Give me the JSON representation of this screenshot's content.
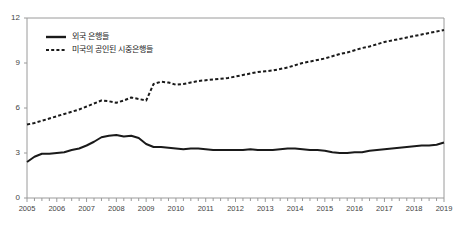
{
  "chart_data": {
    "type": "line",
    "title": "",
    "subtitle": "",
    "xlabel": "",
    "ylabel": "",
    "xlim": [
      2005,
      2019
    ],
    "ylim": [
      0,
      12
    ],
    "yticks": [
      0,
      3,
      6,
      9,
      12
    ],
    "xticks": [
      2005,
      2006,
      2007,
      2008,
      2009,
      2010,
      2011,
      2012,
      2013,
      2014,
      2015,
      2016,
      2017,
      2018,
      2019
    ],
    "grid": false,
    "legend_position": "top-left",
    "minor_ticks_per_year": 4,
    "series": [
      {
        "name": "외국 은행들",
        "style": "solid",
        "color": "#1a1a1a",
        "x": [
          2005.0,
          2005.25,
          2005.5,
          2005.75,
          2006.0,
          2006.25,
          2006.5,
          2006.75,
          2007.0,
          2007.25,
          2007.5,
          2007.75,
          2008.0,
          2008.25,
          2008.5,
          2008.75,
          2009.0,
          2009.25,
          2009.5,
          2009.75,
          2010.0,
          2010.25,
          2010.5,
          2010.75,
          2011.0,
          2011.25,
          2011.5,
          2011.75,
          2012.0,
          2012.25,
          2012.5,
          2012.75,
          2013.0,
          2013.25,
          2013.5,
          2013.75,
          2014.0,
          2014.25,
          2014.5,
          2014.75,
          2015.0,
          2015.25,
          2015.5,
          2015.75,
          2016.0,
          2016.25,
          2016.5,
          2016.75,
          2017.0,
          2017.25,
          2017.5,
          2017.75,
          2018.0,
          2018.25,
          2018.5,
          2018.75,
          2019.0
        ],
        "values": [
          2.4,
          2.75,
          2.95,
          2.95,
          3.0,
          3.05,
          3.2,
          3.3,
          3.5,
          3.75,
          4.05,
          4.15,
          4.2,
          4.1,
          4.15,
          4.0,
          3.6,
          3.4,
          3.4,
          3.35,
          3.3,
          3.25,
          3.3,
          3.3,
          3.25,
          3.2,
          3.2,
          3.2,
          3.2,
          3.2,
          3.25,
          3.2,
          3.2,
          3.2,
          3.25,
          3.3,
          3.3,
          3.25,
          3.2,
          3.2,
          3.15,
          3.05,
          3.0,
          3.0,
          3.05,
          3.05,
          3.15,
          3.2,
          3.25,
          3.3,
          3.35,
          3.4,
          3.45,
          3.5,
          3.5,
          3.55,
          3.7
        ]
      },
      {
        "name": "미국의 공인된 시중은행들",
        "style": "dashed",
        "color": "#1a1a1a",
        "x": [
          2005.0,
          2005.25,
          2005.5,
          2005.75,
          2006.0,
          2006.25,
          2006.5,
          2006.75,
          2007.0,
          2007.25,
          2007.5,
          2007.75,
          2008.0,
          2008.25,
          2008.5,
          2008.75,
          2009.0,
          2009.25,
          2009.5,
          2009.75,
          2010.0,
          2010.25,
          2010.5,
          2010.75,
          2011.0,
          2011.25,
          2011.5,
          2011.75,
          2012.0,
          2012.25,
          2012.5,
          2012.75,
          2013.0,
          2013.25,
          2013.5,
          2013.75,
          2014.0,
          2014.25,
          2014.5,
          2014.75,
          2015.0,
          2015.25,
          2015.5,
          2015.75,
          2016.0,
          2016.25,
          2016.5,
          2016.75,
          2017.0,
          2017.25,
          2017.5,
          2017.75,
          2018.0,
          2018.25,
          2018.5,
          2018.75,
          2019.0
        ],
        "values": [
          4.9,
          5.0,
          5.15,
          5.3,
          5.45,
          5.6,
          5.75,
          5.9,
          6.1,
          6.3,
          6.5,
          6.45,
          6.35,
          6.5,
          6.7,
          6.6,
          6.5,
          7.6,
          7.75,
          7.7,
          7.55,
          7.6,
          7.7,
          7.8,
          7.85,
          7.9,
          7.95,
          8.0,
          8.1,
          8.2,
          8.3,
          8.4,
          8.45,
          8.5,
          8.6,
          8.7,
          8.85,
          9.0,
          9.1,
          9.2,
          9.3,
          9.45,
          9.6,
          9.7,
          9.85,
          10.0,
          10.1,
          10.25,
          10.4,
          10.5,
          10.6,
          10.7,
          10.8,
          10.9,
          11.0,
          11.1,
          11.2
        ]
      }
    ]
  },
  "axis": {
    "y_labels": [
      "0",
      "3",
      "6",
      "9",
      "12"
    ],
    "x_labels": [
      "2005",
      "2006",
      "2007",
      "2008",
      "2009",
      "2010",
      "2011",
      "2012",
      "2013",
      "2014",
      "2015",
      "2016",
      "2017",
      "2018",
      "2019"
    ]
  },
  "legend": {
    "items": [
      {
        "label": "외국 은행들",
        "style": "solid"
      },
      {
        "label": "미국의 공인된 시중은행들",
        "style": "dashed"
      }
    ]
  },
  "colors": {
    "line": "#1a1a1a",
    "axis": "#9a9a9a",
    "tick_text": "#444444",
    "background": "#ffffff"
  }
}
